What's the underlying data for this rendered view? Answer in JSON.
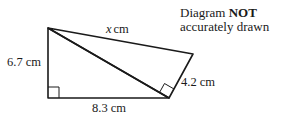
{
  "diagram": {
    "type": "geometry",
    "shapes": "two right-angled triangles sharing a hypotenuse",
    "vertices": {
      "A": {
        "x": 48,
        "y": 28
      },
      "B": {
        "x": 48,
        "y": 98
      },
      "C": {
        "x": 169,
        "y": 98
      },
      "D": {
        "x": 193,
        "y": 54
      }
    },
    "labels": {
      "side_x": "x",
      "side_x_unit": "cm",
      "left_side": "6.7 cm",
      "bottom_side": "8.3 cm",
      "short_side": "4.2 cm"
    },
    "note": {
      "line1_prefix": "Diagram ",
      "line1_bold": "NOT",
      "line2": "accurately drawn"
    },
    "stroke_color": "#1a1a1a"
  }
}
